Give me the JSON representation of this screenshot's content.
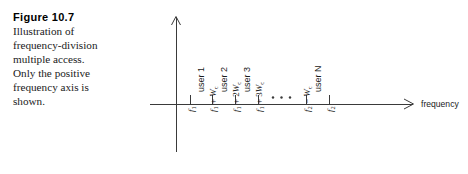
{
  "caption": {
    "title": "Figure 10.7",
    "lines": [
      "Illustration of",
      "frequency-division",
      "multiple access.",
      "Only the positive",
      "frequency axis is",
      "shown."
    ]
  },
  "figure": {
    "axis": {
      "x_label": "frequency",
      "y_label": "",
      "origin_x": 176,
      "baseline_y": 104
    },
    "ellipsis": "· · ·",
    "user_labels": [
      "user 1",
      "user 2",
      "user 3",
      "user N"
    ],
    "ticks": [
      {
        "x": 190,
        "label_parts": {
          "base": "f",
          "base_sub": "1",
          "op": "",
          "term": "",
          "term_sub": ""
        }
      },
      {
        "x": 212,
        "label_parts": {
          "base": "f",
          "base_sub": "1",
          "op": " + ",
          "term": "W",
          "term_sub": "c"
        }
      },
      {
        "x": 235,
        "label_parts": {
          "base": "f",
          "base_sub": "1",
          "op": " + 2",
          "term": "W",
          "term_sub": "c"
        }
      },
      {
        "x": 258,
        "label_parts": {
          "base": "f",
          "base_sub": "1",
          "op": " + 3",
          "term": "W",
          "term_sub": "c"
        }
      },
      {
        "x": 306,
        "label_parts": {
          "base": "f",
          "base_sub": "2",
          "op": " − ",
          "term": "W",
          "term_sub": "c"
        }
      },
      {
        "x": 329,
        "label_parts": {
          "base": "f",
          "base_sub": "2",
          "op": "",
          "term": "",
          "term_sub": ""
        }
      }
    ],
    "tick_labels_text": [
      "f1",
      "f1 + Wc",
      "f1 + 2Wc",
      "f1 + 3Wc",
      "f2 − Wc",
      "f2"
    ]
  },
  "colors": {
    "ink": "#1a1a1a",
    "line": "#3a3a3a",
    "background": "#ffffff"
  }
}
